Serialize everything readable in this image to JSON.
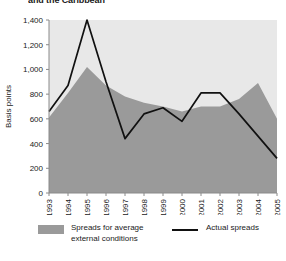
{
  "title": "and the Caribbean",
  "legend": {
    "area_label": "Spreads for average external conditions",
    "area_label_line1": "Spreads for average",
    "area_label_line2": "external conditions",
    "line_label": "Actual spreads",
    "area_color": "#9a9a9a",
    "line_color": "#111111"
  },
  "chart_data": {
    "type": "area",
    "title": "and the Caribbean",
    "xlabel": "",
    "ylabel": "Basis points",
    "categories": [
      "1993",
      "1994",
      "1995",
      "1996",
      "1997",
      "1998",
      "1999",
      "2000",
      "2001",
      "2002",
      "2003",
      "2004",
      "2005"
    ],
    "ylim": [
      0,
      1400
    ],
    "yticks": [
      0,
      200,
      400,
      600,
      800,
      1000,
      1200,
      1400
    ],
    "ytick_labels": [
      "0",
      "200",
      "400",
      "600",
      "800",
      "1,000",
      "1,200",
      "1,400"
    ],
    "grid": false,
    "legend_position": "bottom",
    "plot_background": "#e8e8e8",
    "series": [
      {
        "name": "Spreads for average external conditions",
        "type": "area",
        "color": "#9a9a9a",
        "values": [
          610,
          810,
          1020,
          870,
          780,
          730,
          700,
          660,
          700,
          700,
          760,
          890,
          600
        ]
      },
      {
        "name": "Actual spreads",
        "type": "line",
        "color": "#111111",
        "values": [
          660,
          870,
          1400,
          900,
          440,
          640,
          690,
          580,
          810,
          810,
          640,
          460,
          280
        ]
      }
    ]
  }
}
